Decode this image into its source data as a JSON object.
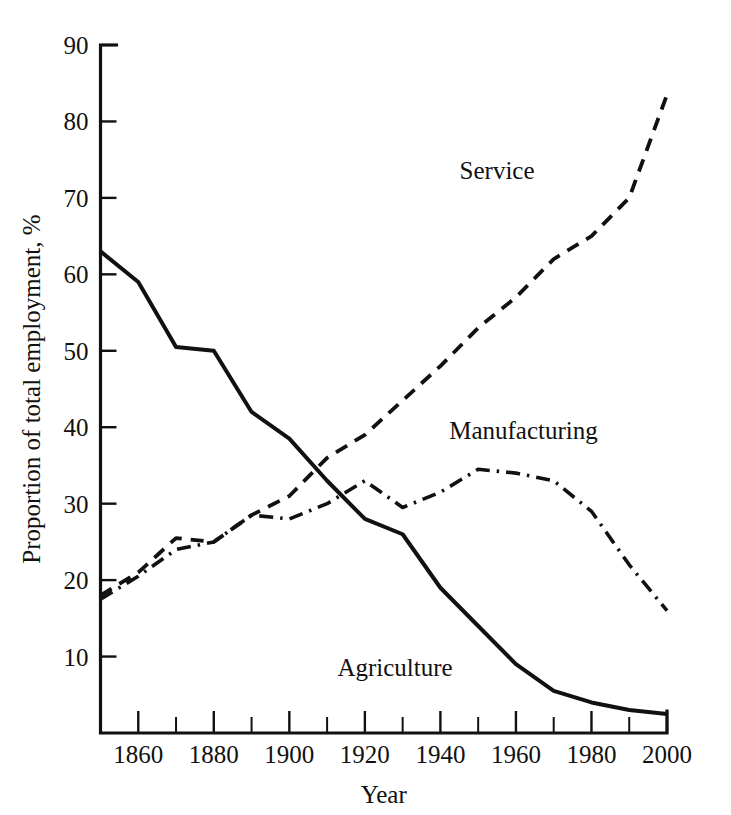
{
  "chart_data": {
    "type": "line",
    "title": "",
    "subtitle": "",
    "xlabel": "Year",
    "ylabel": "Proportion of total employment, %",
    "xlim": [
      1850,
      2000
    ],
    "ylim": [
      0,
      90
    ],
    "grid": false,
    "legend_position": "inline-annotations",
    "x_ticks_major": [
      1860,
      1880,
      1900,
      1920,
      1940,
      1960,
      1980,
      2000
    ],
    "x_tick_labels": [
      "1860",
      "1880",
      "1900",
      "1920",
      "1940",
      "1960",
      "1980",
      "2000"
    ],
    "x_ticks_minor": [
      1850,
      1870,
      1890,
      1910,
      1930,
      1950,
      1970,
      1990
    ],
    "y_ticks": [
      10,
      20,
      30,
      40,
      50,
      60,
      70,
      80,
      90
    ],
    "y_tick_labels": [
      "10",
      "20",
      "30",
      "40",
      "50",
      "60",
      "70",
      "80",
      "90"
    ],
    "x": [
      1850,
      1860,
      1870,
      1880,
      1890,
      1900,
      1910,
      1920,
      1930,
      1940,
      1950,
      1960,
      1970,
      1980,
      1990,
      2000
    ],
    "series": [
      {
        "name": "Agriculture",
        "label": "Agriculture",
        "linestyle": "solid",
        "color": "#111111",
        "values": [
          63,
          59,
          50.5,
          50,
          42,
          38.5,
          33,
          28,
          26,
          19,
          14,
          9,
          5.5,
          4,
          3,
          2.5
        ]
      },
      {
        "name": "Service",
        "label": "Service",
        "linestyle": "dashed",
        "color": "#111111",
        "values": [
          18,
          21,
          25.5,
          25,
          28.5,
          31,
          36,
          39,
          43.5,
          48,
          53,
          57,
          62,
          65,
          70,
          83.5
        ]
      },
      {
        "name": "Manufacturing",
        "label": "Manufacturing",
        "linestyle": "dashdot",
        "color": "#111111",
        "values": [
          17.5,
          20.5,
          24,
          25,
          28.5,
          28,
          30,
          33,
          29.5,
          31.5,
          34.5,
          34,
          33,
          29,
          22,
          16
        ]
      }
    ],
    "annotations": [
      {
        "text": "Service",
        "x": 1955,
        "y": 72.5
      },
      {
        "text": "Manufacturing",
        "x": 1962,
        "y": 38.5
      },
      {
        "text": "Agriculture",
        "x": 1928,
        "y": 7.5
      }
    ]
  }
}
